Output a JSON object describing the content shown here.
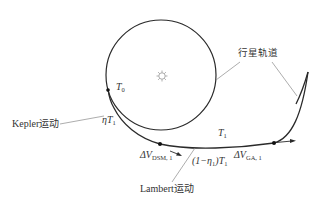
{
  "diagram": {
    "type": "orbital-transfer-schematic",
    "labels": {
      "planet_orbit": "行星轨道",
      "kepler_motion": "Kepler运动",
      "lambert_motion": "Lambert运动",
      "t0": {
        "main": "T",
        "sub": "0"
      },
      "eta_t1": {
        "eta": "η",
        "main": "T",
        "sub": "1"
      },
      "t1": {
        "main": "T",
        "sub": "1"
      },
      "one_minus_eta_t1": {
        "prefix": "(1−η",
        "sub": "1",
        "suffix": ")T",
        "sub2": "1"
      },
      "dv_dsm": {
        "main": "ΔV",
        "sub": "DSM, 1"
      },
      "dv_ga": {
        "main": "ΔV",
        "sub": "GA, 1"
      }
    },
    "elements": [
      "sun-icon",
      "departure-planet-orbit-circle",
      "transfer-trajectory-arc",
      "target-planet-orbit-arc",
      "dsm-point",
      "ga-point",
      "t0-point",
      "dsm-velocity-arrow",
      "ga-velocity-arrow"
    ],
    "colors": {
      "line": "#2a2a2a",
      "leader": "#8a8a8a",
      "sun": "#9a9a9a"
    }
  }
}
